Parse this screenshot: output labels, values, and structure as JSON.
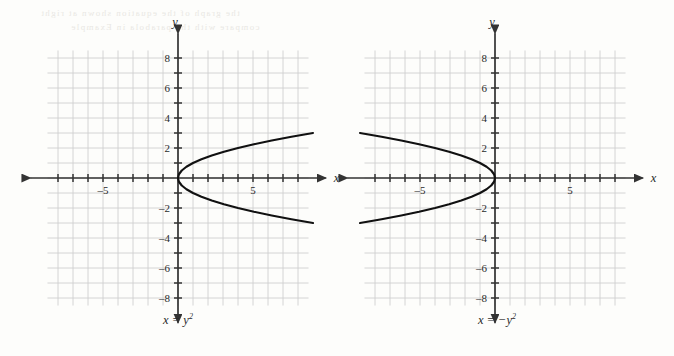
{
  "figure": {
    "background_color": "#fdfdfb",
    "grid_color": "#cfcfcf",
    "axis_color": "#333333",
    "curve_color": "#111111",
    "bleed_lines": [
      "the graph of the equation shown at right",
      "compare with the parabola in Example"
    ]
  },
  "panels": [
    {
      "id": "left",
      "caption_prefix": "x = y",
      "caption_exponent": "2",
      "x_axis_label": "x",
      "y_axis_label": "y",
      "x_tick_labels": [
        "-5",
        "5"
      ],
      "y_tick_labels": [
        "8",
        "6",
        "4",
        "2",
        "-2",
        "-4",
        "-6",
        "-8"
      ]
    },
    {
      "id": "right",
      "caption_prefix": "x = −y",
      "caption_exponent": "2",
      "x_axis_label": "x",
      "y_axis_label": "y",
      "x_tick_labels": [
        "-5",
        "5"
      ],
      "y_tick_labels": [
        "8",
        "6",
        "4",
        "2",
        "-2",
        "-4",
        "-6",
        "-8"
      ]
    }
  ],
  "chart_data": [
    {
      "type": "line",
      "title": "x = y²",
      "xlabel": "x",
      "ylabel": "y",
      "xlim": [
        -9,
        9
      ],
      "ylim": [
        -8.5,
        8.5
      ],
      "grid": true,
      "legend": "none",
      "equation": "x = y^2",
      "orientation": "opens-right",
      "vertex": [
        0,
        0
      ],
      "x_ticks": [
        -8,
        -7,
        -6,
        -5,
        -4,
        -3,
        -2,
        -1,
        1,
        2,
        3,
        4,
        5,
        6,
        7,
        8
      ],
      "x_tick_labels_shown": {
        "-5": "-5",
        "5": "5"
      },
      "y_ticks": [
        -8,
        -7,
        -6,
        -5,
        -4,
        -3,
        -2,
        -1,
        1,
        2,
        3,
        4,
        5,
        6,
        7,
        8
      ],
      "y_tick_labels_shown": {
        "8": "8",
        "6": "6",
        "4": "4",
        "2": "2",
        "-2": "-2",
        "-4": "-4",
        "-6": "-6",
        "-8": "-8"
      },
      "series": [
        {
          "name": "x = y^2",
          "y": [
            -3.0,
            -2.75,
            -2.5,
            -2.25,
            -2.0,
            -1.75,
            -1.5,
            -1.25,
            -1.0,
            -0.75,
            -0.5,
            -0.25,
            0.0,
            0.25,
            0.5,
            0.75,
            1.0,
            1.25,
            1.5,
            1.75,
            2.0,
            2.25,
            2.5,
            2.75,
            3.0
          ],
          "x": [
            9.0,
            7.5625,
            6.25,
            5.0625,
            4.0,
            3.0625,
            2.25,
            1.5625,
            1.0,
            0.5625,
            0.25,
            0.0625,
            0.0,
            0.0625,
            0.25,
            0.5625,
            1.0,
            1.5625,
            2.25,
            3.0625,
            4.0,
            5.0625,
            6.25,
            7.5625,
            9.0
          ]
        }
      ]
    },
    {
      "type": "line",
      "title": "x = −y²",
      "xlabel": "x",
      "ylabel": "y",
      "xlim": [
        -9,
        9
      ],
      "ylim": [
        -8.5,
        8.5
      ],
      "grid": true,
      "legend": "none",
      "equation": "x = -y^2",
      "orientation": "opens-left",
      "vertex": [
        0,
        0
      ],
      "x_ticks": [
        -8,
        -7,
        -6,
        -5,
        -4,
        -3,
        -2,
        -1,
        1,
        2,
        3,
        4,
        5,
        6,
        7,
        8
      ],
      "x_tick_labels_shown": {
        "-5": "-5",
        "5": "5"
      },
      "y_ticks": [
        -8,
        -7,
        -6,
        -5,
        -4,
        -3,
        -2,
        -1,
        1,
        2,
        3,
        4,
        5,
        6,
        7,
        8
      ],
      "y_tick_labels_shown": {
        "8": "8",
        "6": "6",
        "4": "4",
        "2": "2",
        "-2": "-2",
        "-4": "-4",
        "-6": "-6",
        "-8": "-8"
      },
      "series": [
        {
          "name": "x = -y^2",
          "y": [
            -3.0,
            -2.75,
            -2.5,
            -2.25,
            -2.0,
            -1.75,
            -1.5,
            -1.25,
            -1.0,
            -0.75,
            -0.5,
            -0.25,
            0.0,
            0.25,
            0.5,
            0.75,
            1.0,
            1.25,
            1.5,
            1.75,
            2.0,
            2.25,
            2.5,
            2.75,
            3.0
          ],
          "x": [
            -9.0,
            -7.5625,
            -6.25,
            -5.0625,
            -4.0,
            -3.0625,
            -2.25,
            -1.5625,
            -1.0,
            -0.5625,
            -0.25,
            -0.0625,
            0.0,
            -0.0625,
            -0.25,
            -0.5625,
            -1.0,
            -1.5625,
            -2.25,
            -3.0625,
            -4.0,
            -5.0625,
            -6.25,
            -7.5625,
            -9.0
          ]
        }
      ]
    }
  ]
}
